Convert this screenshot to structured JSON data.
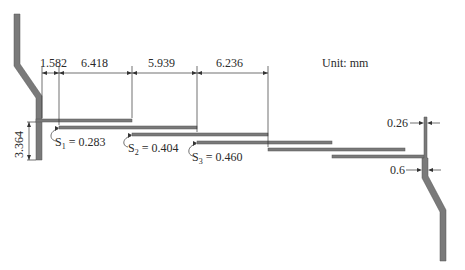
{
  "diagram": {
    "unit_label": "Unit: mm",
    "colors": {
      "plate": "#7a7a7a",
      "line": "#333333",
      "background": "#ffffff"
    },
    "horizontal_dimensions": [
      {
        "id": "d1",
        "value": "1.582"
      },
      {
        "id": "d2",
        "value": "6.418"
      },
      {
        "id": "d3",
        "value": "5.939"
      },
      {
        "id": "d4",
        "value": "6.236"
      }
    ],
    "vertical_dimension": {
      "value": "3.364"
    },
    "gaps": [
      {
        "symbol": "S",
        "index": "1",
        "eq": " = 0.283"
      },
      {
        "symbol": "S",
        "index": "2",
        "eq": " = 0.404"
      },
      {
        "symbol": "S",
        "index": "3",
        "eq": " = 0.460"
      }
    ],
    "thickness_labels": [
      {
        "id": "t1",
        "value": "0.26"
      },
      {
        "id": "t2",
        "value": "0.6"
      }
    ]
  }
}
